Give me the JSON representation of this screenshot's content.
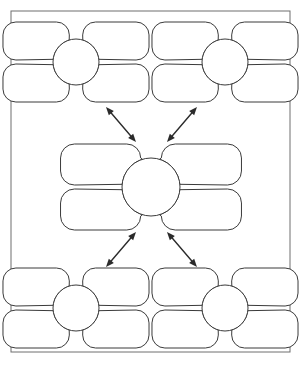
{
  "page": {
    "background_color": "#ffffff",
    "width": 304,
    "height": 371,
    "frame": {
      "name": "page-border",
      "x": 11,
      "y": 11,
      "width": 279,
      "height": 341,
      "stroke_color": "#6e6e6e",
      "stroke_width": 1
    }
  },
  "style": {
    "shape_fill": "#ffffff",
    "shape_stroke": "#3a3a3a",
    "shape_stroke_width": 1,
    "arrow_color": "#2b2b2b",
    "arrow_stroke_width": 1.4
  },
  "diagram": {
    "type": "concept-map",
    "layout": "quincunx",
    "node_shape": "four-petal-flower",
    "node_count": 5,
    "connector_count": 4,
    "connector_style": "double-headed-arrow",
    "all_fields_blank": true,
    "nodes": [
      {
        "id": "node-top-left",
        "name": "flower-node-top-left",
        "role": "satellite",
        "label": "",
        "center_x": 76,
        "center_y": 62,
        "circle_radius": 23,
        "petal_width": 56,
        "petal_height": 38,
        "petal_labels": [
          "",
          "",
          "",
          ""
        ]
      },
      {
        "id": "node-top-right",
        "name": "flower-node-top-right",
        "role": "satellite",
        "label": "",
        "center_x": 225,
        "center_y": 62,
        "circle_radius": 23,
        "petal_width": 56,
        "petal_height": 38,
        "petal_labels": [
          "",
          "",
          "",
          ""
        ]
      },
      {
        "id": "node-center",
        "name": "flower-node-center",
        "role": "hub",
        "label": "",
        "center_x": 151,
        "center_y": 187,
        "circle_radius": 29,
        "petal_width": 69,
        "petal_height": 41,
        "petal_labels": [
          "",
          "",
          "",
          ""
        ]
      },
      {
        "id": "node-bottom-left",
        "name": "flower-node-bottom-left",
        "role": "satellite",
        "label": "",
        "center_x": 76,
        "center_y": 308,
        "circle_radius": 23,
        "petal_width": 56,
        "petal_height": 38,
        "petal_labels": [
          "",
          "",
          "",
          ""
        ]
      },
      {
        "id": "node-bottom-right",
        "name": "flower-node-bottom-right",
        "role": "satellite",
        "label": "",
        "center_x": 225,
        "center_y": 308,
        "circle_radius": 23,
        "petal_width": 56,
        "petal_height": 38,
        "petal_labels": [
          "",
          "",
          "",
          ""
        ]
      }
    ],
    "connectors": [
      {
        "id": "connector-center-top-left",
        "name": "arrow-center-to-top-left",
        "from": "node-center",
        "to": "node-top-left",
        "bidirectional": true,
        "label": "",
        "x1": 136,
        "y1": 142,
        "x2": 106,
        "y2": 107
      },
      {
        "id": "connector-center-top-right",
        "name": "arrow-center-to-top-right",
        "from": "node-center",
        "to": "node-top-right",
        "bidirectional": true,
        "label": "",
        "x1": 167,
        "y1": 142,
        "x2": 197,
        "y2": 107
      },
      {
        "id": "connector-center-bottom-left",
        "name": "arrow-center-to-bottom-left",
        "from": "node-center",
        "to": "node-bottom-left",
        "bidirectional": true,
        "label": "",
        "x1": 136,
        "y1": 232,
        "x2": 106,
        "y2": 267
      },
      {
        "id": "connector-center-bottom-right",
        "name": "arrow-center-to-bottom-right",
        "from": "node-center",
        "to": "node-bottom-right",
        "bidirectional": true,
        "label": "",
        "x1": 167,
        "y1": 232,
        "x2": 197,
        "y2": 267
      }
    ]
  }
}
